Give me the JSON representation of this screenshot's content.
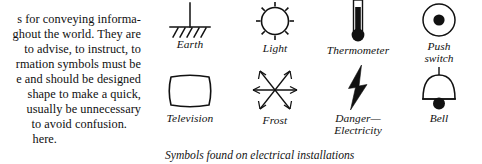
{
  "document": {
    "type": "book-page-scan",
    "body_text": {
      "partial_top_line": "",
      "lines": [
        "s for conveying informa-",
        "ghout the world. They are",
        "to advise, to instruct, to",
        "rmation symbols must be",
        "e and should be designed",
        "shape to make a quick,",
        "usually be unnecessary",
        "to avoid confusion.",
        "here."
      ]
    },
    "figure": {
      "caption": "Symbols found on electrical installations",
      "symbols": [
        {
          "id": "earth",
          "label": "Earth",
          "label_line2": "",
          "icon": "earth-ground-icon"
        },
        {
          "id": "light",
          "label": "Light",
          "label_line2": "",
          "icon": "sun-light-icon"
        },
        {
          "id": "thermometer",
          "label": "Thermometer",
          "label_line2": "",
          "icon": "thermometer-icon"
        },
        {
          "id": "push-switch",
          "label": "Push",
          "label_line2": "switch",
          "icon": "push-switch-icon"
        },
        {
          "id": "television",
          "label": "Television",
          "label_line2": "",
          "icon": "television-screen-icon"
        },
        {
          "id": "frost",
          "label": "Frost",
          "label_line2": "",
          "icon": "frost-snowflake-icon"
        },
        {
          "id": "danger",
          "label": "Danger—",
          "label_line2": "Electricity",
          "icon": "lightning-bolt-icon"
        },
        {
          "id": "bell",
          "label": "Bell",
          "label_line2": "",
          "icon": "bell-icon"
        }
      ]
    },
    "colors": {
      "ink": "#111111",
      "paper": "#ffffff"
    }
  }
}
